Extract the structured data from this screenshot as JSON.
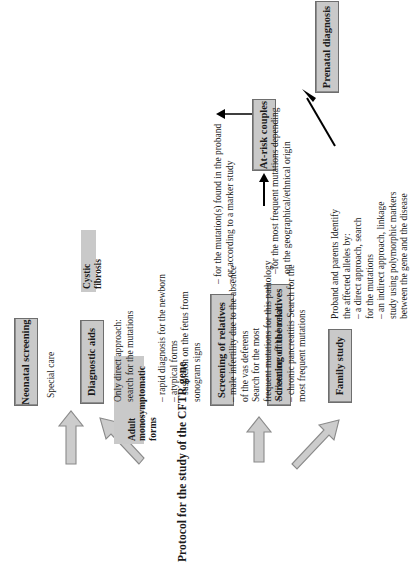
{
  "figure": {
    "title": "Protocol for the study of the CFTR gene",
    "type": "flowchart",
    "orientation": "rotated-90-ccw",
    "colors": {
      "box_fill": "#c9c9c9",
      "box_border": "#6e6e6e",
      "text": "#1a1a1a",
      "hollow_arrow_fill": "#c9c9c9",
      "hollow_arrow_stroke": "#808080",
      "solid_arrow": "#000000",
      "page_background": "#ffffff"
    }
  },
  "nodes": {
    "neonatal_screening": {
      "label": "Neonatal screening"
    },
    "diagnostic_aids": {
      "label": "Diagnostic aids"
    },
    "screening_of_relatives": {
      "label": "Screening of relatives"
    },
    "screening_of_the_relatives": {
      "label": "Screening of the relatives"
    },
    "family_study": {
      "label": "Family study"
    },
    "at_risk_couples": {
      "label": "At-risk couples"
    },
    "prenatal_diagnosis": {
      "label": "Prenatal diagnosis"
    }
  },
  "tags": {
    "cystic_fibrosis": {
      "label": "Cystic fibrosis"
    },
    "adult_monosymptomatic": {
      "label": "Adult\nmonosymptomatic forms"
    }
  },
  "annotations": {
    "special_care": "Special care",
    "diagnostic_aids_body": "Only direct approach:\nsearch for the mutations",
    "cystic_fibrosis_body": "– rapid diagnosis for the newborn\n– atypical forms\n– suspicion on the fetus from\n   sonogram signs",
    "adult_monosymptomatic_body": "– male infertility due to the absence\n   of the vas deferens\nSearch for the most\nfrequent mutations for this pathology\n– dilatation of the bronchi\n– chronic pancreatitis Search for the\n   most frequent mutations",
    "screening_of_relatives_body": "– for the mutation(s) found in the proband\n– or according to a marker study",
    "screening_of_the_relatives_body": "–for the most frequent mutations depending\non the geographical/ethnical origin",
    "family_study_body": "Proband and parents Identify\nthe affected alleles by:\n– a direct approach, search\n   for the mutations\n– an indirect approach, linkage\n   study using polymorphic markers\n   between the gene and the disease"
  },
  "edges": [
    {
      "name": "title-to-neonatal-screening",
      "style": "hollow-block-arrow",
      "from": "title",
      "to": "neonatal_screening"
    },
    {
      "name": "title-to-diagnostic-aids",
      "style": "hollow-block-arrow",
      "from": "title",
      "to": "diagnostic_aids"
    },
    {
      "name": "title-to-screening-of-relatives",
      "style": "hollow-block-arrow",
      "from": "title",
      "to": "screening_of_relatives"
    },
    {
      "name": "title-to-family-study",
      "style": "hollow-block-arrow",
      "from": "title",
      "to": "family_study"
    },
    {
      "name": "relatives-to-at-risk-couples",
      "style": "solid-arrow",
      "from": "screening_of_the_relatives",
      "to": "at_risk_couples"
    },
    {
      "name": "at-risk-couples-to-prenatal-diagnosis",
      "style": "solid-elbow-arrow",
      "from": "at_risk_couples",
      "to": "prenatal_diagnosis"
    },
    {
      "name": "family-study-to-prenatal-diagnosis",
      "style": "solid-arrow",
      "from": "family_study",
      "to": "prenatal_diagnosis"
    }
  ]
}
